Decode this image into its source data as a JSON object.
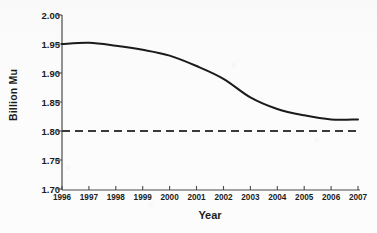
{
  "chart_data": {
    "type": "line",
    "title": "",
    "xlabel": "Year",
    "ylabel": "Billion Mu",
    "categories": [
      "1996",
      "1997",
      "1998",
      "1999",
      "2000",
      "2001",
      "2002",
      "2003",
      "2004",
      "2005",
      "2006",
      "2007"
    ],
    "x": [
      1996,
      1997,
      1998,
      1999,
      2000,
      2001,
      2002,
      2003,
      2004,
      2005,
      2006,
      2007
    ],
    "series": [
      {
        "name": "Cultivated land area",
        "style": "solid",
        "color": "#1a1a1a",
        "values": [
          1.95,
          1.952,
          1.947,
          1.94,
          1.93,
          1.912,
          1.89,
          1.858,
          1.838,
          1.827,
          1.82,
          1.82
        ]
      },
      {
        "name": "Reference line",
        "style": "dashed",
        "color": "#3a3a3a",
        "constant_value": 1.8,
        "values": [
          1.8,
          1.8,
          1.8,
          1.8,
          1.8,
          1.8,
          1.8,
          1.8,
          1.8,
          1.8,
          1.8,
          1.8
        ]
      }
    ],
    "ylim": [
      1.7,
      2.0
    ],
    "yticks": [
      2.0,
      1.95,
      1.9,
      1.85,
      1.8,
      1.75,
      1.7
    ],
    "ytick_labels": [
      "2.00",
      "1.95",
      "1.90",
      "1.85",
      "1.80",
      "1.75",
      "1.70"
    ],
    "xlim": [
      1996,
      2007
    ],
    "grid": false,
    "legend": "none",
    "annotations": []
  },
  "axes": {
    "y_axis_title": "Billion Mu",
    "x_axis_title": "Year"
  }
}
